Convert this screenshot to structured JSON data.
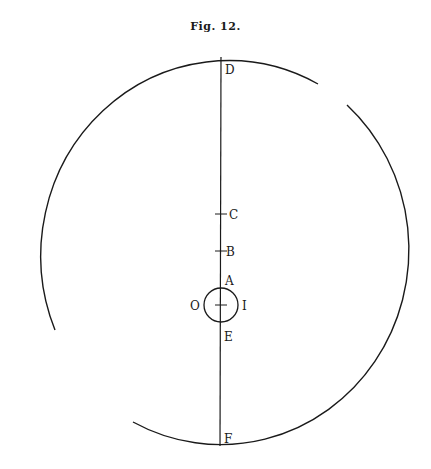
{
  "figure": {
    "title": "Fig. 12.",
    "labels": {
      "D": "D",
      "C": "C",
      "B": "B",
      "A": "A",
      "O": "O",
      "I": "I",
      "E": "E",
      "F": "F"
    },
    "colors": {
      "ink": "#1a1a1a",
      "background": "#ffffff"
    }
  }
}
